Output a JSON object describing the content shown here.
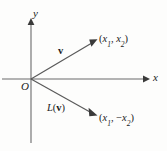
{
  "figure": {
    "type": "vector-reflection-diagram",
    "width": 167,
    "height": 151,
    "background_color": "#fdfdfc",
    "line_color": "#4a4a4a",
    "text_color": "#1b1b1b"
  },
  "axes": {
    "y_label": "y",
    "x_label": "x",
    "origin_label": "O",
    "origin_px": [
      31,
      79
    ],
    "x_axis": {
      "start_px": [
        2,
        79
      ],
      "arrow_tip_px": [
        149,
        79
      ]
    },
    "y_axis": {
      "start_px": [
        31,
        143
      ],
      "arrow_tip_px": [
        31,
        18
      ]
    }
  },
  "vectors": [
    {
      "name": "v",
      "label": "v",
      "label_style": "bold",
      "from_px": [
        31,
        79
      ],
      "to_px": [
        97,
        40
      ],
      "endpoint_label": {
        "open": "(",
        "var1": "x",
        "sub1": "1",
        "sep": ", ",
        "sign2": "",
        "var2": "x",
        "sub2": "2",
        "close": ")"
      }
    },
    {
      "name": "L(v)",
      "label_function": "L",
      "label_open": "(",
      "label_arg": "v",
      "label_close": ")",
      "label_style": "italic-with-bold-arg",
      "from_px": [
        31,
        79
      ],
      "to_px": [
        97,
        116
      ],
      "endpoint_label": {
        "open": "(",
        "var1": "x",
        "sub1": "1",
        "sep": ", ",
        "sign2": "−",
        "var2": "x",
        "sub2": "2",
        "close": ")"
      }
    }
  ]
}
